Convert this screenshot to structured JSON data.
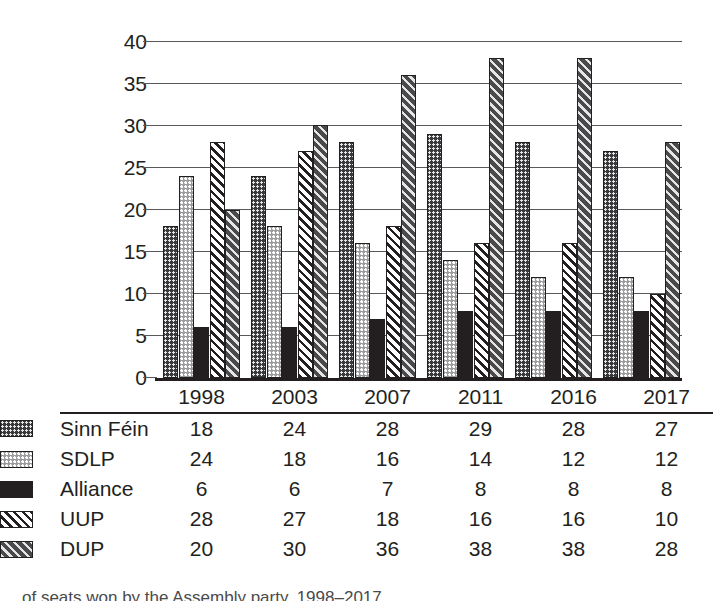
{
  "chart_data": {
    "type": "bar",
    "title": "",
    "xlabel": "",
    "ylabel": "",
    "categories": [
      "1998",
      "2003",
      "2007",
      "2011",
      "2016",
      "2017"
    ],
    "ylim": [
      0,
      40
    ],
    "yticks": [
      0,
      5,
      10,
      15,
      20,
      25,
      30,
      35,
      40
    ],
    "grid": true,
    "legend_position": "bottom-table",
    "series": [
      {
        "name": "Sinn Féin",
        "values": [
          18,
          24,
          28,
          29,
          28,
          27
        ],
        "pattern": "dark-dotted",
        "color": "#3a3a3c"
      },
      {
        "name": "SDLP",
        "values": [
          24,
          18,
          16,
          14,
          12,
          12
        ],
        "pattern": "light-dotted",
        "color": "#9b9b9e"
      },
      {
        "name": "Alliance",
        "values": [
          6,
          6,
          7,
          8,
          8,
          8
        ],
        "pattern": "solid-dark",
        "color": "#231f20"
      },
      {
        "name": "UUP",
        "values": [
          28,
          27,
          18,
          16,
          16,
          10
        ],
        "pattern": "white-diagonal-stripes",
        "color": "#ffffff"
      },
      {
        "name": "DUP",
        "values": [
          20,
          30,
          36,
          38,
          38,
          28
        ],
        "pattern": "dark-diagonal-stripes",
        "color": "#4a4a4c"
      }
    ]
  },
  "axis": {
    "y_tick_labels": [
      "40",
      "35",
      "30",
      "25",
      "20",
      "15",
      "10",
      "5",
      "0"
    ]
  },
  "table": {
    "year_headers": [
      "1998",
      "2003",
      "2007",
      "2011",
      "2016",
      "2017"
    ],
    "rows": [
      {
        "label": "Sinn Féin",
        "values": [
          "18",
          "24",
          "28",
          "29",
          "28",
          "27"
        ]
      },
      {
        "label": "SDLP",
        "values": [
          "24",
          "18",
          "16",
          "14",
          "12",
          "12"
        ]
      },
      {
        "label": "Alliance",
        "values": [
          "6",
          "6",
          "7",
          "8",
          "8",
          "8"
        ]
      },
      {
        "label": "UUP",
        "values": [
          "28",
          "27",
          "18",
          "16",
          "16",
          "10"
        ]
      },
      {
        "label": "DUP",
        "values": [
          "20",
          "30",
          "36",
          "38",
          "38",
          "28"
        ]
      }
    ]
  },
  "caption": {
    "text": "of seats won by the Assembly party, 1998–2017"
  }
}
